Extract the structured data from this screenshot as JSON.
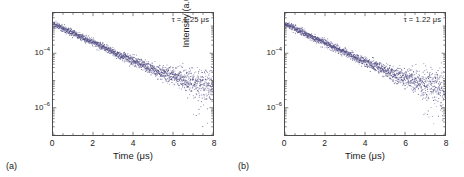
{
  "figure": {
    "background": "#ffffff",
    "marker_color": "#4f4a82",
    "axis_color": "#4d4d4d",
    "text_color": "#1a1a1a"
  },
  "panels": [
    {
      "tag": "(a)",
      "annotation": "τ = 1.25 μs",
      "chart_data": {
        "type": "scatter",
        "title": "",
        "xlabel": "Time (μs)",
        "ylabel": "Intensity (a.u.)",
        "xlim": [
          0,
          8
        ],
        "ylim": [
          1e-07,
          0.003
        ],
        "yscale": "log",
        "xscale": "linear",
        "xticks": [
          0,
          2,
          4,
          6,
          8
        ],
        "xticklabels": [
          "0",
          "2",
          "4",
          "6",
          "8"
        ],
        "yticks": [
          0.0001,
          1e-06
        ],
        "yticklabels": [
          "10⁻⁴",
          "10⁻⁶"
        ],
        "grid": false,
        "legend": false,
        "annotations": [
          {
            "text": "τ = 1.25 μs",
            "position": "top-right",
            "lifetime_us": 1.25
          }
        ],
        "model": {
          "description": "single-exponential photoluminescence decay plus flat noise floor, log-scaled intensity",
          "amplitude": 0.0012,
          "lifetime_us": 1.25,
          "noise_floor": 4e-06,
          "noise_floor_log_sigma": 0.42,
          "signal_log_sigma": 0.06,
          "n_points": 1700,
          "seed": 1025
        },
        "series": [
          {
            "name": "PL decay",
            "color": "#4f4a82",
            "marker": "dot",
            "marker_size": 1.0,
            "x_range": [
              0,
              8
            ],
            "curve_reference": [
              {
                "x": 0.0,
                "y": 0.0012
              },
              {
                "x": 0.25,
                "y": 0.00098
              },
              {
                "x": 0.5,
                "y": 0.0008
              },
              {
                "x": 1.0,
                "y": 0.00054
              },
              {
                "x": 1.5,
                "y": 0.00036
              },
              {
                "x": 2.0,
                "y": 0.00024
              },
              {
                "x": 2.5,
                "y": 0.00016
              },
              {
                "x": 3.0,
                "y": 0.00011
              },
              {
                "x": 3.5,
                "y": 7.3e-05
              },
              {
                "x": 4.0,
                "y": 4.9e-05
              },
              {
                "x": 5.0,
                "y": 2.2e-05
              },
              {
                "x": 6.0,
                "y": 9.6e-06
              },
              {
                "x": 7.0,
                "y": 4.3e-06
              },
              {
                "x": 8.0,
                "y": 1.9e-06
              }
            ]
          }
        ]
      }
    },
    {
      "tag": "(b)",
      "annotation": "τ = 1.22 μs",
      "chart_data": {
        "type": "scatter",
        "title": "",
        "xlabel": "Time (μs)",
        "ylabel": "Intensity (a.u.)",
        "xlim": [
          0,
          8
        ],
        "ylim": [
          1e-07,
          0.003
        ],
        "yscale": "log",
        "xscale": "linear",
        "xticks": [
          0,
          2,
          4,
          6,
          8
        ],
        "xticklabels": [
          "0",
          "2",
          "4",
          "6",
          "8"
        ],
        "yticks": [
          0.0001,
          1e-06
        ],
        "yticklabels": [
          "10⁻⁴",
          "10⁻⁶"
        ],
        "grid": false,
        "legend": false,
        "annotations": [
          {
            "text": "τ = 1.22 μs",
            "position": "top-right",
            "lifetime_us": 1.22
          }
        ],
        "model": {
          "description": "single-exponential photoluminescence decay plus flat noise floor, log-scaled intensity",
          "amplitude": 0.0012,
          "lifetime_us": 1.22,
          "noise_floor": 3.6e-06,
          "noise_floor_log_sigma": 0.45,
          "signal_log_sigma": 0.06,
          "n_points": 1700,
          "seed": 1022
        },
        "series": [
          {
            "name": "PL decay",
            "color": "#4f4a82",
            "marker": "dot",
            "marker_size": 1.0,
            "x_range": [
              0,
              8
            ],
            "curve_reference": [
              {
                "x": 0.0,
                "y": 0.0012
              },
              {
                "x": 0.25,
                "y": 0.00097
              },
              {
                "x": 0.5,
                "y": 0.00079
              },
              {
                "x": 1.0,
                "y": 0.00052
              },
              {
                "x": 1.5,
                "y": 0.00034
              },
              {
                "x": 2.0,
                "y": 0.00023
              },
              {
                "x": 2.5,
                "y": 0.00015
              },
              {
                "x": 3.0,
                "y": 9.9e-05
              },
              {
                "x": 3.5,
                "y": 6.5e-05
              },
              {
                "x": 4.0,
                "y": 4.3e-05
              },
              {
                "x": 5.0,
                "y": 1.9e-05
              },
              {
                "x": 6.0,
                "y": 8e-06
              },
              {
                "x": 7.0,
                "y": 3.5e-06
              },
              {
                "x": 8.0,
                "y": 1.5e-06
              }
            ]
          }
        ]
      }
    }
  ]
}
